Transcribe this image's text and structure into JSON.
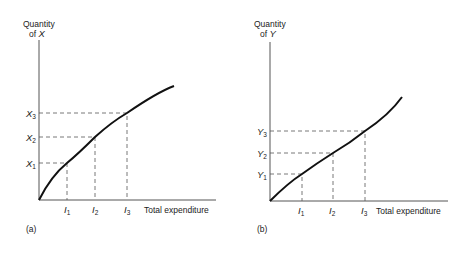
{
  "panels": [
    {
      "id": "a",
      "caption": "(a)",
      "y_axis_label_line1": "Quantity",
      "y_axis_label_line2_prefix": "of ",
      "y_axis_label_var": "X",
      "x_axis_label": "Total expenditure",
      "y_ticks": [
        {
          "base": "X",
          "sub": "1"
        },
        {
          "base": "X",
          "sub": "2"
        },
        {
          "base": "X",
          "sub": "3"
        }
      ],
      "x_ticks": [
        {
          "base": "I",
          "sub": "1"
        },
        {
          "base": "I",
          "sub": "2"
        },
        {
          "base": "I",
          "sub": "3"
        }
      ],
      "curve_shape": "concave"
    },
    {
      "id": "b",
      "caption": "(b)",
      "y_axis_label_line1": "Quantity",
      "y_axis_label_line2_prefix": "of ",
      "y_axis_label_var": "Y",
      "x_axis_label": "Total expenditure",
      "y_ticks": [
        {
          "base": "Y",
          "sub": "1"
        },
        {
          "base": "Y",
          "sub": "2"
        },
        {
          "base": "Y",
          "sub": "3"
        }
      ],
      "x_ticks": [
        {
          "base": "I",
          "sub": "1"
        },
        {
          "base": "I",
          "sub": "2"
        },
        {
          "base": "I",
          "sub": "3"
        }
      ],
      "curve_shape": "concave-then-convex"
    }
  ]
}
